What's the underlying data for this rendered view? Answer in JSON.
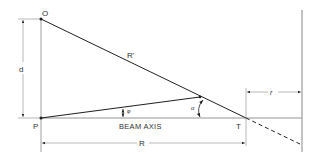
{
  "diagram": {
    "labels": {
      "O": "O",
      "P": "P",
      "T": "T",
      "d": "d",
      "R": "R",
      "R_prime": "R'",
      "r": "r",
      "phi": "φ",
      "alpha": "α",
      "beam_axis": "BEAM AXIS"
    },
    "colors": {
      "line": "#222222",
      "thin_line": "#888888",
      "text": "#333333"
    }
  }
}
